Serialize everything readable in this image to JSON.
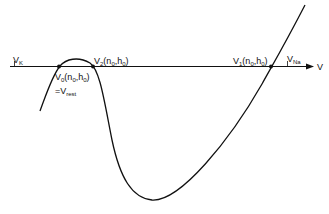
{
  "diagram": {
    "type": "phase-line / nullcline plot",
    "axis": {
      "label": "V",
      "ticks": [
        {
          "name": "V_K",
          "main": "V",
          "sub": "K"
        },
        {
          "name": "V_Na",
          "main": "V",
          "sub": "Na"
        }
      ]
    },
    "fixed_points": [
      {
        "id": "V0",
        "main": "V",
        "sub": "0",
        "args": "(n",
        "args_sub1": "0",
        "args_mid": ",h",
        "args_sub2": "0",
        "args_end": ")"
      },
      {
        "id": "V2",
        "main": "V",
        "sub": "2",
        "args": "(n",
        "args_sub1": "0",
        "args_mid": ",h",
        "args_sub2": "0",
        "args_end": ")"
      },
      {
        "id": "V1",
        "main": "V",
        "sub": "1",
        "args": "(n",
        "args_sub1": "0",
        "args_mid": ",h",
        "args_sub2": "0",
        "args_end": ")"
      }
    ],
    "rest_label": {
      "prefix": "=V",
      "sub": "rest"
    },
    "colors": {
      "line": "#111111",
      "background": "#ffffff"
    }
  }
}
